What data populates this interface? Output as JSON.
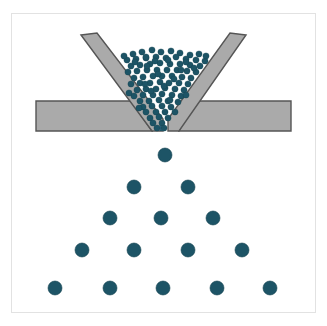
{
  "figure": {
    "type": "technical-illustration",
    "width": 327,
    "height": 326,
    "background_color": "#ffffff",
    "frame": {
      "border_color": "#e2e2e2",
      "x": 11,
      "y": 13,
      "width": 305,
      "height": 300
    }
  },
  "labels": {
    "outlet": "L"
  },
  "colors": {
    "particle_fill": "#1d5466",
    "particle_stroke": "#12414f",
    "hopper_fill": "#aaaaaa",
    "hopper_stroke": "#555555",
    "frame_border": "#e2e2e2",
    "background": "#ffffff"
  },
  "chart_data": {
    "type": "scatter",
    "xlabel": "",
    "ylabel": "",
    "xlim": [
      11,
      316
    ],
    "ylim": [
      13,
      313
    ],
    "grid": false,
    "legend": null,
    "annotations": [
      {
        "text": "L",
        "x": 162,
        "y": 128,
        "note": "outlet aperture width label"
      }
    ],
    "geometry": {
      "left_wall": {
        "name": "left-hopper-wall",
        "fill": "#aaaaaa",
        "stroke": "#555555",
        "points": [
          [
            81,
            35
          ],
          [
            97,
            33
          ],
          [
            163,
            119
          ],
          [
            163,
            131
          ],
          [
            152,
            131
          ]
        ]
      },
      "right_wall": {
        "name": "right-hopper-wall",
        "fill": "#aaaaaa",
        "stroke": "#555555",
        "points": [
          [
            246,
            35
          ],
          [
            230,
            33
          ],
          [
            168,
            119
          ],
          [
            168,
            131
          ],
          [
            179,
            131
          ]
        ]
      },
      "left_base_plate": {
        "name": "left-base-plate",
        "fill": "#aaaaaa",
        "stroke": "#555555",
        "points": [
          [
            36,
            101
          ],
          [
            131,
            101
          ],
          [
            152,
            131
          ],
          [
            36,
            131
          ]
        ]
      },
      "right_base_plate": {
        "name": "right-base-plate",
        "fill": "#aaaaaa",
        "stroke": "#555555",
        "points": [
          [
            291,
            101
          ],
          [
            196,
            101
          ],
          [
            179,
            131
          ],
          [
            291,
            131
          ]
        ]
      },
      "outlet_gap": {
        "x_left": 163,
        "x_right": 168,
        "y": 131,
        "width": 5
      }
    },
    "series": [
      {
        "name": "hopper-bulk-particles",
        "marker": "circle",
        "color": "#1d5466",
        "radius": 3.1,
        "count": 96,
        "region": "inverted triangle inside hopper",
        "points": [
          [
            133,
            54
          ],
          [
            142,
            52
          ],
          [
            152,
            50
          ],
          [
            161,
            52
          ],
          [
            171,
            51
          ],
          [
            180,
            53
          ],
          [
            190,
            55
          ],
          [
            199,
            54
          ],
          [
            127,
            60
          ],
          [
            136,
            59
          ],
          [
            146,
            58
          ],
          [
            156,
            57
          ],
          [
            166,
            58
          ],
          [
            176,
            57
          ],
          [
            186,
            59
          ],
          [
            196,
            60
          ],
          [
            205,
            61
          ],
          [
            131,
            66
          ],
          [
            140,
            65
          ],
          [
            150,
            64
          ],
          [
            160,
            63
          ],
          [
            170,
            64
          ],
          [
            180,
            64
          ],
          [
            190,
            65
          ],
          [
            200,
            66
          ],
          [
            128,
            72
          ],
          [
            137,
            71
          ],
          [
            147,
            70
          ],
          [
            157,
            70
          ],
          [
            167,
            70
          ],
          [
            177,
            70
          ],
          [
            187,
            71
          ],
          [
            196,
            72
          ],
          [
            134,
            78
          ],
          [
            143,
            77
          ],
          [
            153,
            76
          ],
          [
            162,
            76
          ],
          [
            172,
            76
          ],
          [
            182,
            77
          ],
          [
            191,
            78
          ],
          [
            131,
            84
          ],
          [
            140,
            83
          ],
          [
            150,
            83
          ],
          [
            160,
            82
          ],
          [
            169,
            83
          ],
          [
            179,
            83
          ],
          [
            188,
            84
          ],
          [
            137,
            90
          ],
          [
            146,
            89
          ],
          [
            156,
            89
          ],
          [
            165,
            88
          ],
          [
            175,
            89
          ],
          [
            184,
            90
          ],
          [
            134,
            96
          ],
          [
            143,
            95
          ],
          [
            153,
            95
          ],
          [
            162,
            94
          ],
          [
            172,
            95
          ],
          [
            181,
            96
          ],
          [
            140,
            101
          ],
          [
            149,
            101
          ],
          [
            159,
            100
          ],
          [
            168,
            101
          ],
          [
            178,
            102
          ],
          [
            143,
            107
          ],
          [
            152,
            106
          ],
          [
            162,
            106
          ],
          [
            171,
            107
          ],
          [
            146,
            112
          ],
          [
            156,
            112
          ],
          [
            165,
            112
          ],
          [
            150,
            118
          ],
          [
            159,
            117
          ],
          [
            168,
            118
          ],
          [
            153,
            123
          ],
          [
            162,
            123
          ],
          [
            157,
            128
          ],
          [
            164,
            128
          ],
          [
            146,
            57
          ],
          [
            186,
            62
          ],
          [
            124,
            56
          ],
          [
            206,
            56
          ],
          [
            129,
            93
          ],
          [
            186,
            95
          ],
          [
            139,
            108
          ],
          [
            175,
            112
          ],
          [
            155,
            61
          ],
          [
            147,
            66
          ],
          [
            174,
            79
          ],
          [
            164,
            86
          ],
          [
            151,
            91
          ],
          [
            170,
            100
          ],
          [
            145,
            84
          ],
          [
            181,
            70
          ],
          [
            158,
            74
          ],
          [
            168,
            60
          ],
          [
            135,
            62
          ],
          [
            194,
            68
          ]
        ]
      },
      {
        "name": "falling-single-particle",
        "marker": "circle",
        "color": "#1d5466",
        "radius": 7,
        "count": 1,
        "points": [
          [
            165,
            155
          ]
        ]
      },
      {
        "name": "dispersed-particle-row-1",
        "marker": "circle",
        "color": "#1d5466",
        "radius": 7,
        "count": 2,
        "points": [
          [
            134,
            187
          ],
          [
            188,
            187
          ]
        ]
      },
      {
        "name": "dispersed-particle-row-2",
        "marker": "circle",
        "color": "#1d5466",
        "radius": 7,
        "count": 3,
        "points": [
          [
            110,
            218
          ],
          [
            161,
            218
          ],
          [
            213,
            218
          ]
        ]
      },
      {
        "name": "dispersed-particle-row-3",
        "marker": "circle",
        "color": "#1d5466",
        "radius": 7,
        "count": 4,
        "points": [
          [
            82,
            250
          ],
          [
            134,
            250
          ],
          [
            188,
            250
          ],
          [
            242,
            250
          ]
        ]
      },
      {
        "name": "dispersed-particle-row-4",
        "marker": "circle",
        "color": "#1d5466",
        "radius": 7,
        "count": 5,
        "points": [
          [
            55,
            288
          ],
          [
            110,
            288
          ],
          [
            163,
            288
          ],
          [
            217,
            288
          ],
          [
            270,
            288
          ]
        ]
      }
    ]
  }
}
